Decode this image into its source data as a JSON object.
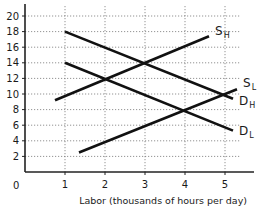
{
  "chart_data": {
    "type": "line",
    "title": "",
    "xlabel": "Labor (thousands of hours per day)",
    "ylabel": "",
    "xlim": [
      0,
      5.5
    ],
    "ylim": [
      0,
      21
    ],
    "x_ticks": [
      "0",
      "1",
      "2",
      "3",
      "4",
      "5"
    ],
    "y_ticks": [
      "2",
      "4",
      "6",
      "8",
      "10",
      "12",
      "14",
      "16",
      "18",
      "20"
    ],
    "grid": true,
    "grid_style": "dotted",
    "legend": "inline labels at right end of each line",
    "series": [
      {
        "name": "S_H",
        "label_main": "S",
        "label_sub": "H",
        "points": [
          [
            0.75,
            9.2
          ],
          [
            2,
            12
          ],
          [
            3,
            14
          ],
          [
            4.6,
            17.4
          ]
        ]
      },
      {
        "name": "S_L",
        "label_main": "S",
        "label_sub": "L",
        "points": [
          [
            1.35,
            2.5
          ],
          [
            4,
            8
          ],
          [
            5.3,
            10.6
          ]
        ]
      },
      {
        "name": "D_H",
        "label_main": "D",
        "label_sub": "H",
        "points": [
          [
            1,
            18
          ],
          [
            3,
            14
          ],
          [
            5.2,
            9.4
          ]
        ]
      },
      {
        "name": "D_L",
        "label_main": "D",
        "label_sub": "L",
        "points": [
          [
            1,
            14
          ],
          [
            2,
            12
          ],
          [
            4,
            8
          ],
          [
            5.2,
            5.3
          ]
        ]
      }
    ],
    "intersections": [
      {
        "lines": [
          "S_H",
          "D_H"
        ],
        "x": 3,
        "y": 14
      },
      {
        "lines": [
          "S_H",
          "D_L"
        ],
        "x": 2,
        "y": 12
      },
      {
        "lines": [
          "S_L",
          "D_L"
        ],
        "x": 4,
        "y": 8
      }
    ]
  },
  "labels": {
    "origin": "0",
    "xaxis_title": "Labor (thousands of hours per day)"
  },
  "colors": {
    "line": "#111111",
    "axis": "#222222",
    "grid": "#777777",
    "background": "#ffffff"
  }
}
